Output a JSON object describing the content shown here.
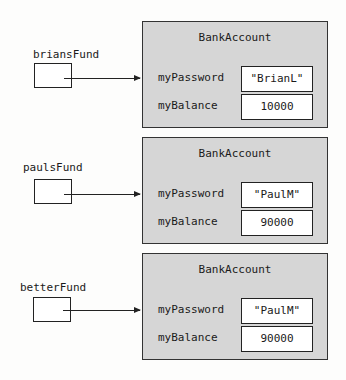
{
  "diagram": {
    "class_name": "BankAccount",
    "field_names": [
      "myPassword",
      "myBalance"
    ],
    "references": [
      {
        "variable": "briansFund",
        "object": {
          "class": "BankAccount",
          "myPassword": "\"BrianL\"",
          "myBalance": "10000"
        }
      },
      {
        "variable": "paulsFund",
        "object": {
          "class": "BankAccount",
          "myPassword": "\"PaulM\"",
          "myBalance": "90000"
        }
      },
      {
        "variable": "betterFund",
        "object": {
          "class": "BankAccount",
          "myPassword": "\"PaulM\"",
          "myBalance": "90000"
        }
      }
    ],
    "colors": {
      "object_fill": "#d6d6d6",
      "stroke": "#222222",
      "value_fill": "#ffffff"
    }
  }
}
